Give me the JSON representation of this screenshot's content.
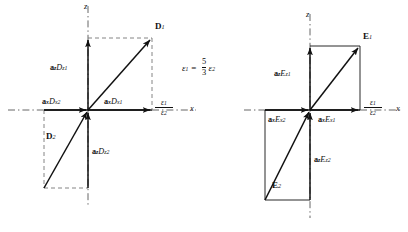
{
  "figure": {
    "relation": {
      "lhs": "ε",
      "lhs_sub": "1",
      "equals": "=",
      "numerator": "5",
      "denominator": "3",
      "rhs": "ε",
      "rhs_sub": "2"
    },
    "colors": {
      "ink": "#111111",
      "dash": "#777777",
      "background": "#ffffff"
    }
  },
  "left_diagram": {
    "name": "flux-density-diagram",
    "quantity_symbol": "D",
    "unit_vector_symbol": "a",
    "construction_line_style": "dashed",
    "axes": {
      "x_label": "x",
      "z_label": "z",
      "interface": {
        "numerator": "ε",
        "numerator_sub": "1",
        "denominator": "ε",
        "denominator_sub": "2"
      }
    },
    "vectors": [
      {
        "name": "D",
        "sub": "1",
        "region": "upper-right",
        "label": "D₁"
      },
      {
        "name": "D",
        "sub": "2",
        "region": "lower-left",
        "label": "D₂"
      }
    ],
    "components": [
      {
        "unit": "a",
        "unit_sub": "z",
        "mag": "D",
        "mag_sub": "z1",
        "direction": "up"
      },
      {
        "unit": "a",
        "unit_sub": "x",
        "mag": "D",
        "mag_sub": "x1",
        "direction": "right"
      },
      {
        "unit": "a",
        "unit_sub": "x",
        "mag": "D",
        "mag_sub": "x2",
        "direction": "right"
      },
      {
        "unit": "a",
        "unit_sub": "z",
        "mag": "D",
        "mag_sub": "z2",
        "direction": "up"
      }
    ]
  },
  "right_diagram": {
    "name": "electric-field-diagram",
    "quantity_symbol": "E",
    "unit_vector_symbol": "a",
    "construction_line_style": "solid",
    "axes": {
      "x_label": "x",
      "z_label": "z",
      "interface": {
        "numerator": "ε",
        "numerator_sub": "1",
        "denominator": "ε",
        "denominator_sub": "2"
      }
    },
    "vectors": [
      {
        "name": "E",
        "sub": "1",
        "region": "upper-right",
        "label": "E₁"
      },
      {
        "name": "E",
        "sub": "2",
        "region": "lower-left",
        "label": "E₂"
      }
    ],
    "components": [
      {
        "unit": "a",
        "unit_sub": "z",
        "mag": "E",
        "mag_sub": "z1",
        "direction": "up"
      },
      {
        "unit": "a",
        "unit_sub": "x",
        "mag": "E",
        "mag_sub": "x1",
        "direction": "right"
      },
      {
        "unit": "a",
        "unit_sub": "x",
        "mag": "E",
        "mag_sub": "x2",
        "direction": "right"
      },
      {
        "unit": "a",
        "unit_sub": "z",
        "mag": "E",
        "mag_sub": "z2",
        "direction": "up"
      }
    ]
  }
}
